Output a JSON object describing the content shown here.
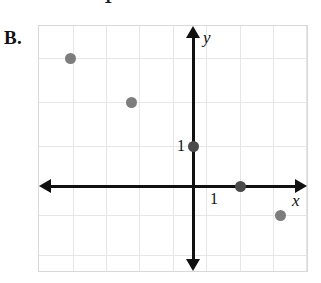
{
  "figure": {
    "panel_label": "B.",
    "clipped_top_text": "1"
  },
  "axes": {
    "x_label": "x",
    "y_label": "y",
    "x_tick_label": "1",
    "y_tick_label": "1",
    "origin_px": {
      "x": 154,
      "y": 160
    },
    "unit_px": {
      "x": 47,
      "y": 40
    },
    "grid_color": "#e6e6e6",
    "axis_color": "#111111",
    "point_color": "#7d7d7d"
  },
  "chart_data": {
    "type": "scatter",
    "title": "",
    "xlabel": "x",
    "ylabel": "y",
    "grid": true,
    "legend": "none",
    "xlim": [
      -3.3,
      3.3
    ],
    "ylim": [
      -3.4,
      3.6
    ],
    "x_tick_labels": [
      "1"
    ],
    "y_tick_labels": [
      "1"
    ],
    "series": [
      {
        "name": "points",
        "marker": "circle",
        "color": "#7d7d7d",
        "points": [
          {
            "x": -2.65,
            "y": 3.2
          },
          {
            "x": -1.35,
            "y": 2.1
          },
          {
            "x": 0,
            "y": 1
          },
          {
            "x": 1.8,
            "y": 0
          },
          {
            "x": 2.65,
            "y": -0.73
          }
        ]
      }
    ]
  },
  "points_px": [
    {
      "name": "point-1",
      "left": 31,
      "top": 32,
      "shade": "light"
    },
    {
      "name": "point-2",
      "left": 92,
      "top": 76,
      "shade": "light"
    },
    {
      "name": "point-3",
      "left": 154,
      "top": 120,
      "shade": "dark"
    },
    {
      "name": "point-4",
      "left": 201,
      "top": 160,
      "shade": "dark"
    },
    {
      "name": "point-5",
      "left": 241,
      "top": 189,
      "shade": "light"
    }
  ],
  "grid_px": {
    "vertical": [
      34,
      67,
      100,
      134,
      167,
      201,
      234,
      267
    ],
    "horizontal": [
      32,
      76,
      120,
      160,
      189,
      229
    ]
  }
}
